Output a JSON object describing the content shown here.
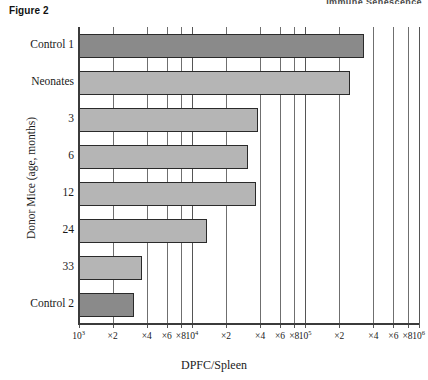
{
  "figure": {
    "label": "Figure 2",
    "cut_header": "Immune Senescence"
  },
  "chart_data": {
    "type": "bar",
    "orientation": "horizontal",
    "title": "Figure 2",
    "xlabel": "DPFC/Spleen",
    "ylabel": "Donor Mice (age, months)",
    "xscale": "log",
    "xlim": [
      1000,
      1000000
    ],
    "grid": true,
    "legend": "none",
    "categories": [
      "Control 1",
      "Neonates",
      "3",
      "6",
      "12",
      "24",
      "33",
      "Control 2"
    ],
    "values": [
      330000,
      250000,
      38000,
      31000,
      37000,
      13500,
      3600,
      3100
    ],
    "value_labels": [
      "3.3×10⁵",
      "2.5×10⁵",
      "3.8×10⁴",
      "3.1×10⁴",
      "3.7×10⁴",
      "1.35×10⁴",
      "3.6×10³",
      "3.1×10³"
    ],
    "bar_colors": [
      "#8a8a8a",
      "#b5b5b5",
      "#b5b5b5",
      "#b5b5b5",
      "#b5b5b5",
      "#b5b5b5",
      "#b5b5b5",
      "#8a8a8a"
    ],
    "xticks": [
      1000,
      2000,
      4000,
      6000,
      8000,
      10000,
      20000,
      40000,
      60000,
      80000,
      100000,
      200000,
      400000,
      600000,
      800000,
      1000000
    ],
    "xtick_labels": [
      {
        "base": "10",
        "exp": "3"
      },
      {
        "base": "×2",
        "exp": ""
      },
      {
        "base": "×4",
        "exp": ""
      },
      {
        "base": "×6",
        "exp": ""
      },
      {
        "base": "×8",
        "exp": ""
      },
      {
        "base": "10",
        "exp": "4"
      },
      {
        "base": "×2",
        "exp": ""
      },
      {
        "base": "×4",
        "exp": ""
      },
      {
        "base": "×6",
        "exp": ""
      },
      {
        "base": "×8",
        "exp": ""
      },
      {
        "base": "10",
        "exp": "5"
      },
      {
        "base": "×2",
        "exp": ""
      },
      {
        "base": "×4",
        "exp": ""
      },
      {
        "base": "×6",
        "exp": ""
      },
      {
        "base": "×8",
        "exp": ""
      },
      {
        "base": "10",
        "exp": "6"
      }
    ]
  },
  "axes": {
    "x_title": "DPFC/Spleen",
    "y_title": "Donor Mice (age, months)"
  },
  "colors": {
    "bar_dark": "#8a8a8a",
    "bar_light": "#b5b5b5",
    "bar_edge": "#2a2a2a",
    "grid": "#6f6f6f",
    "axis": "#3b3b3b",
    "text": "#1a1a1a",
    "background": "#ffffff"
  }
}
